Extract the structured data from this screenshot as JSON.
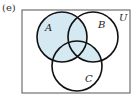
{
  "part_label": "(e)",
  "universal_label": "U",
  "sets": [
    {
      "name": "A",
      "cx": 62,
      "cy": 37,
      "r": 25
    },
    {
      "name": "B",
      "cx": 93,
      "cy": 37,
      "r": 25
    },
    {
      "name": "C",
      "cx": 77,
      "cy": 66,
      "r": 25
    }
  ],
  "shaded_region": "A ∪ (B ∩ C)",
  "colors": {
    "shade": "#d4e9f2",
    "stroke": "#111111",
    "frame": "#555555"
  }
}
